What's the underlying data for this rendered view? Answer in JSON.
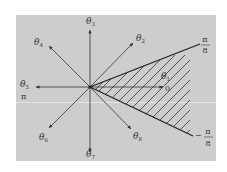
{
  "diagram": {
    "background_color": "#cdcdcd",
    "line_color": "#333333",
    "center": {
      "x": 90,
      "y": 87
    },
    "directions": [
      {
        "id": "theta1",
        "label": "θ",
        "sub": "1",
        "angle_label": "0",
        "tip": {
          "x": 163,
          "y": 87
        }
      },
      {
        "id": "theta2",
        "label": "θ",
        "sub": "2",
        "tip": {
          "x": 133,
          "y": 43
        }
      },
      {
        "id": "theta3",
        "label": "θ",
        "sub": "3",
        "tip": {
          "x": 90,
          "y": 30
        }
      },
      {
        "id": "theta4",
        "label": "θ",
        "sub": "4",
        "tip": {
          "x": 49,
          "y": 46
        }
      },
      {
        "id": "theta5",
        "label": "θ",
        "sub": "5",
        "angle_label": "π",
        "tip": {
          "x": 36,
          "y": 87
        }
      },
      {
        "id": "theta6",
        "label": "θ",
        "sub": "6",
        "tip": {
          "x": 49,
          "y": 128
        }
      },
      {
        "id": "theta7",
        "label": "θ",
        "sub": "7",
        "tip": {
          "x": 90,
          "y": 152
        }
      },
      {
        "id": "theta8",
        "label": "θ",
        "sub": "8",
        "tip": {
          "x": 131,
          "y": 129
        }
      }
    ],
    "sector": {
      "upper_label_num": "π",
      "upper_label_den": "8",
      "lower_label_sign": "−",
      "lower_label_num": "π",
      "lower_label_den": "8",
      "fill": "hatched"
    }
  }
}
